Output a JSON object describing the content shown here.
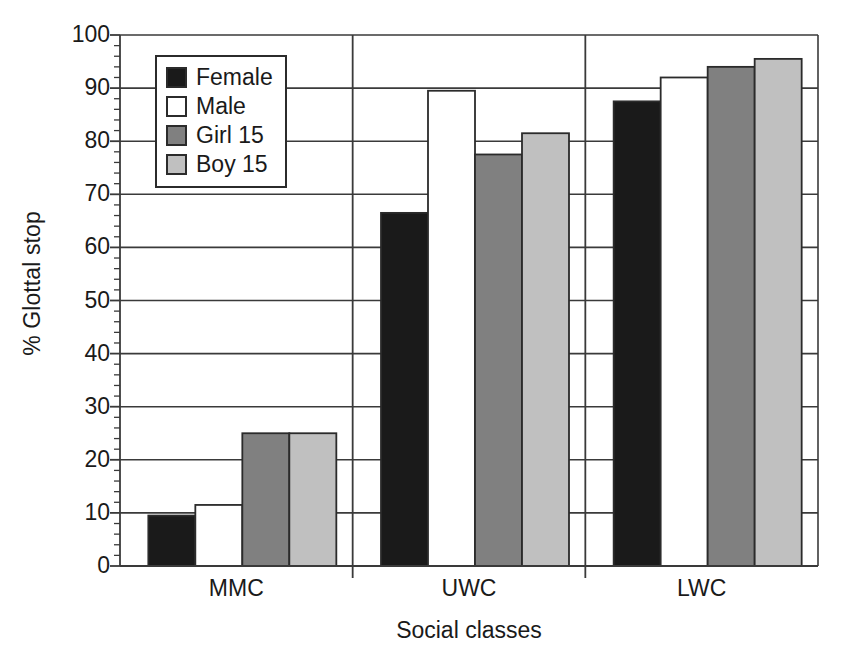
{
  "chart_data": {
    "type": "bar",
    "title": "",
    "xlabel": "Social classes",
    "ylabel": "% Glottal stop",
    "categories": [
      "MMC",
      "UWC",
      "LWC"
    ],
    "series": [
      {
        "name": "Female",
        "color": "#1a1a1a",
        "values": [
          9.5,
          66.5,
          87.5
        ]
      },
      {
        "name": "Male",
        "color": "#ffffff",
        "values": [
          11.5,
          89.5,
          92.0
        ]
      },
      {
        "name": "Girl 15",
        "color": "#808080",
        "values": [
          25.0,
          77.5,
          94.0
        ]
      },
      {
        "name": "Boy 15",
        "color": "#c0c0c0",
        "values": [
          25.0,
          81.5,
          95.5
        ]
      }
    ],
    "ylim": [
      0,
      100
    ],
    "ytick_values": [
      0,
      10,
      20,
      30,
      40,
      50,
      60,
      70,
      80,
      90,
      100
    ],
    "ytick_labels": [
      "0",
      "10",
      "20",
      "30",
      "40",
      "50",
      "60",
      "70",
      "80",
      "90",
      "100"
    ],
    "yminor_step": 2,
    "grid": "horizontal-major",
    "legend_position": "top-left-inside",
    "group_separators": true,
    "frame_color": "#3a3a3a",
    "bar_edge_color": "#2b2b2b"
  }
}
